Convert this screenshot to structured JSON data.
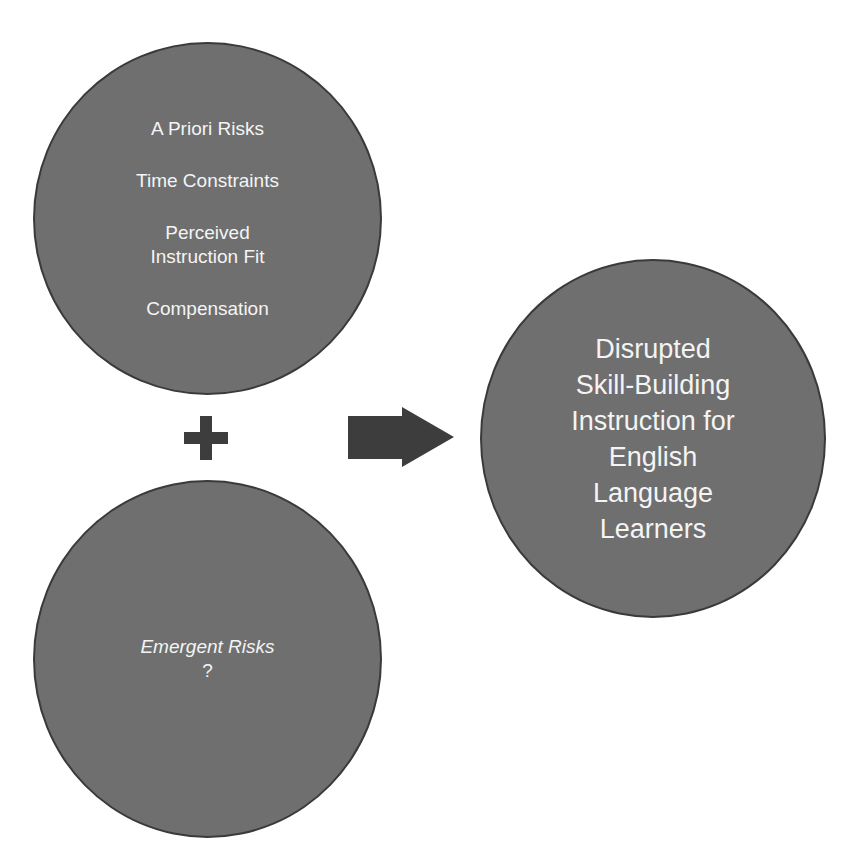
{
  "diagram": {
    "top_circle": {
      "items": [
        "A Priori Risks",
        "Time Constraints",
        "Perceived Instruction Fit",
        "Compensation"
      ],
      "perceived_line1": "Perceived",
      "perceived_line2": "Instruction Fit"
    },
    "operator": {
      "icon": "plus-icon"
    },
    "bottom_circle": {
      "title": "Emergent Risks",
      "subtitle": "?"
    },
    "connector": {
      "icon": "arrow-right-icon"
    },
    "outcome_circle": {
      "lines": [
        "Disrupted",
        "Skill-Building",
        "Instruction for",
        "English",
        "Language",
        "Learners"
      ]
    },
    "colors": {
      "circle_fill": "#6f6f6f",
      "circle_border": "#3a3a3a",
      "shape_dark": "#3d3d3d",
      "text": "#f4f4f4",
      "background": "#ffffff"
    }
  }
}
